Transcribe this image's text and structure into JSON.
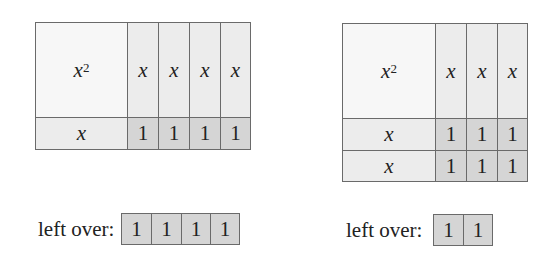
{
  "left_diagram": {
    "square": "x",
    "square_exp": "2",
    "column_labels": [
      "x",
      "x",
      "x",
      "x"
    ],
    "row_labels": [
      "x"
    ],
    "cell_value": "1",
    "leftover_label": "left over:",
    "leftover_cells": [
      "1",
      "1",
      "1",
      "1"
    ]
  },
  "right_diagram": {
    "square": "x",
    "square_exp": "2",
    "column_labels": [
      "x",
      "x",
      "x"
    ],
    "row_labels": [
      "x",
      "x"
    ],
    "cell_value": "1",
    "leftover_label": "left over:",
    "leftover_cells": [
      "1",
      "1"
    ]
  },
  "colors": {
    "square": "#f7f7f7",
    "strip": "#ececec",
    "unit": "#d5d5d5",
    "border": "#6a6a6a"
  }
}
